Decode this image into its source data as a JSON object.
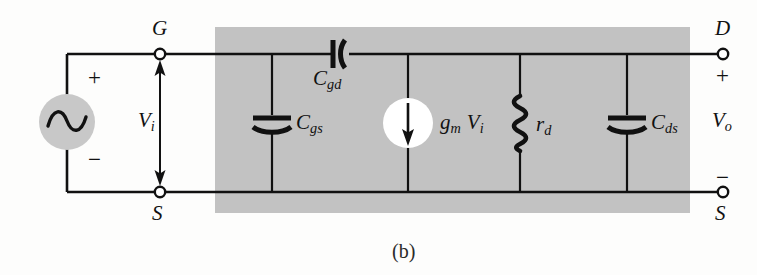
{
  "figure": {
    "caption": "(b)",
    "type": "small-signal-equivalent-circuit",
    "colors": {
      "wire": "#111111",
      "shaded_box": "#c2c2c2",
      "source_fill": "#c8c8c8",
      "current_source_fill": "#ffffff",
      "background": "#fdfdfc"
    }
  },
  "source": {
    "symbol": "ac-sine",
    "plus_sign": "+",
    "minus_sign": "−"
  },
  "input": {
    "label_base": "V",
    "label_sub": "i",
    "arrow_style": "double-headed-vertical"
  },
  "output": {
    "label_base": "V",
    "label_sub": "o",
    "plus_sign": "+",
    "minus_sign": "−"
  },
  "terminals": {
    "gate": "G",
    "source_left": "S",
    "drain": "D",
    "source_right": "S"
  },
  "components": [
    {
      "id": "cgs",
      "kind": "capacitor",
      "orientation": "vertical-branch",
      "label_base": "C",
      "label_sub": "gs",
      "x": 272
    },
    {
      "id": "cgd",
      "kind": "capacitor",
      "orientation": "series-horizontal",
      "label_base": "C",
      "label_sub": "gd",
      "x": 340
    },
    {
      "id": "gmvi",
      "kind": "current-source",
      "orientation": "vertical-branch",
      "label_base": "g",
      "label_sub": "m",
      "label_base2": "V",
      "label_sub2": "i",
      "x": 408
    },
    {
      "id": "rd",
      "kind": "resistor",
      "orientation": "vertical-branch",
      "label_base": "r",
      "label_sub": "d",
      "x": 520
    },
    {
      "id": "cds",
      "kind": "capacitor",
      "orientation": "vertical-branch",
      "label_base": "C",
      "label_sub": "ds",
      "x": 627
    }
  ]
}
